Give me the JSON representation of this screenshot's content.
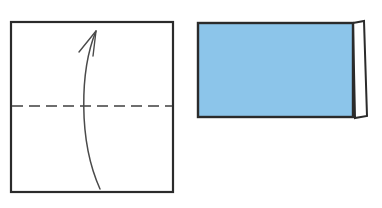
{
  "figure": {
    "kind": "origami-fold-instruction",
    "background_color": "#ffffff",
    "width": 382,
    "height": 208,
    "panel_count": 2
  },
  "panels": [
    {
      "id": "before-fold",
      "label": "before-fold",
      "shape": "square",
      "fill_color": "#ffffff",
      "stroke_color": "#2b2b2b",
      "stroke_width": 2.2,
      "x": 11,
      "y": 22,
      "width": 162,
      "height": 170,
      "crease": {
        "id": "valley-fold-line",
        "style": "dashed",
        "orientation": "horizontal",
        "color": "#6e6e6e",
        "stroke_width": 1.8,
        "dash_length": 11,
        "dash_gap": 6,
        "x1": 12,
        "x2": 172,
        "y": 106
      },
      "arrow": {
        "id": "fold-direction-arrow",
        "direction": "upward",
        "curvature": "curved-left-bulge",
        "color": "#4a4a4a",
        "stroke_width": 1.5,
        "tail_x": 100,
        "tail_y": 189,
        "tip_x": 96,
        "tip_y": 31,
        "control1_x": 78,
        "control1_y": 140,
        "control2_x": 80,
        "control2_y": 70,
        "head_barb1_x": 79,
        "head_barb1_y": 52,
        "head_barb2_x": 93,
        "head_barb2_y": 56
      }
    },
    {
      "id": "after-fold",
      "label": "after-fold",
      "shape": "rectangle",
      "fill_color": "#8cc5ea",
      "stroke_color": "#2b2b2b",
      "stroke_width": 2.4,
      "x": 198,
      "y": 23,
      "width": 155,
      "height": 94,
      "flap": {
        "id": "folded-edge-flap",
        "fill_color": "#ffffff",
        "stroke_color": "#2b2b2b",
        "stroke_width": 2.0,
        "points": "353,23 364,21 367,116 355,118"
      }
    }
  ],
  "colors": {
    "paper_blue": "#8cc5ea",
    "ink_black": "#2b2b2b",
    "crease_gray": "#6e6e6e",
    "arrow_gray": "#4a4a4a",
    "background_white": "#ffffff"
  }
}
